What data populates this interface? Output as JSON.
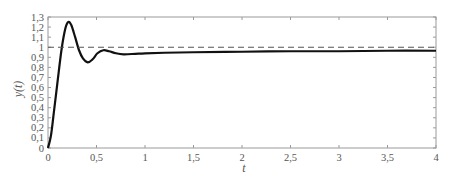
{
  "chart_data": {
    "type": "line",
    "title": "",
    "xlabel": "t",
    "ylabel": "y(t)",
    "xlim": [
      0,
      4
    ],
    "ylim": [
      0,
      1.3
    ],
    "grid": false,
    "legend": null,
    "x_ticks": [
      0,
      0.5,
      1,
      1.5,
      2,
      2.5,
      3,
      3.5,
      4
    ],
    "x_tick_labels": [
      "0",
      "0,5",
      "1",
      "1,5",
      "2",
      "2,5",
      "3",
      "3,5",
      "4"
    ],
    "y_ticks": [
      0,
      0.1,
      0.2,
      0.3,
      0.4,
      0.5,
      0.6,
      0.7,
      0.8,
      0.9,
      1,
      1.1,
      1.2,
      1.3
    ],
    "y_tick_labels": [
      "0",
      "0,1",
      "0,2",
      "0,3",
      "0,4",
      "0,5",
      "0,6",
      "0,7",
      "0,8",
      "0,9",
      "1",
      "1,1",
      "1,2",
      "1,3"
    ],
    "series": [
      {
        "name": "y(t)",
        "style": "solid",
        "color": "#111111",
        "x": [
          0,
          0.03,
          0.06,
          0.1,
          0.14,
          0.18,
          0.21,
          0.24,
          0.28,
          0.32,
          0.36,
          0.41,
          0.46,
          0.51,
          0.57,
          0.63,
          0.7,
          0.78,
          0.9,
          1.0,
          1.2,
          1.5,
          2.0,
          2.5,
          3.0,
          3.5,
          4.0
        ],
        "values": [
          0,
          0.12,
          0.35,
          0.67,
          0.98,
          1.19,
          1.25,
          1.22,
          1.1,
          0.97,
          0.89,
          0.85,
          0.88,
          0.94,
          0.97,
          0.96,
          0.94,
          0.93,
          0.935,
          0.94,
          0.945,
          0.95,
          0.955,
          0.96,
          0.96,
          0.965,
          0.965
        ]
      },
      {
        "name": "reference",
        "style": "dashed",
        "color": "#555555",
        "x": [
          0,
          4
        ],
        "values": [
          1,
          1
        ]
      }
    ]
  }
}
